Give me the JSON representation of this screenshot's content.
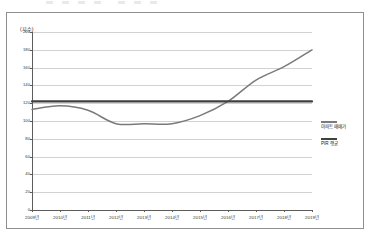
{
  "chart_data": {
    "type": "line",
    "title": "",
    "xlabel": "",
    "ylabel": "(지수)",
    "ylim": [
      0,
      200
    ],
    "ytick_step": 20,
    "grid": true,
    "legend_position": "right",
    "categories": [
      "2009년",
      "2010년",
      "2011년",
      "2012년",
      "2013년",
      "2014년",
      "2015년",
      "2016년",
      "2017년",
      "2018년",
      "2019년"
    ],
    "yticks": [
      "200",
      "180",
      "160",
      "140",
      "120",
      "100",
      "80",
      "60",
      "40",
      "20",
      "0"
    ],
    "series": [
      {
        "name": "아파트 매매가",
        "color": "#7a7a7a",
        "values": [
          113,
          117,
          112,
          97,
          97,
          97,
          106,
          122,
          146,
          161,
          180
        ]
      },
      {
        "name": "PIR 평균",
        "color": "#3f3f3f",
        "kind": "reference-line",
        "values": [
          122,
          122,
          122,
          122,
          122,
          122,
          122,
          122,
          122,
          122,
          122
        ]
      }
    ]
  },
  "legend": {
    "items": [
      {
        "label": "아파트 매매가",
        "color": "#7a7a7a"
      },
      {
        "label": "PIR 평균",
        "color": "#3f3f3f"
      }
    ]
  }
}
